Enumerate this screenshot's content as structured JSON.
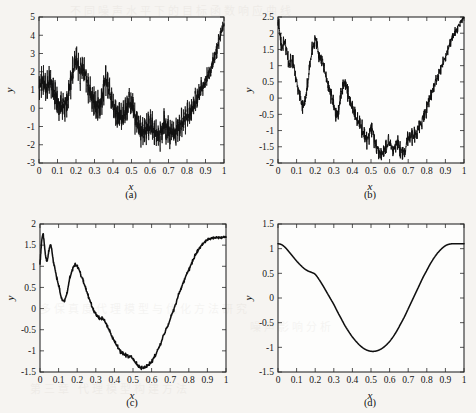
{
  "figure": {
    "layout": "2x2 grid of line plots",
    "background_color": "#f6f4f1",
    "line_color": "#101010",
    "axis_color": "#2a2a2a"
  },
  "labels": {
    "xlabel": "x",
    "ylabel": "y",
    "caption_a": "(a)",
    "caption_b": "(b)",
    "caption_c": "(c)",
    "caption_d": "(d)"
  },
  "xticks": [
    "0",
    "0.1",
    "0.2",
    "0.3",
    "0.4",
    "0.5",
    "0.6",
    "0.7",
    "0.8",
    "0.9",
    "1"
  ],
  "chart_data": [
    {
      "type": "line",
      "panel": "a",
      "title": "(a)",
      "xlabel": "x",
      "ylabel": "y",
      "xlim": [
        0,
        1
      ],
      "ylim": [
        -3,
        5
      ],
      "xticks": [
        0,
        0.1,
        0.2,
        0.3,
        0.4,
        0.5,
        0.6,
        0.7,
        0.8,
        0.9,
        1
      ],
      "xticklabels": [
        "0",
        "0.1",
        "0.2",
        "0.3",
        "0.4",
        "0.5",
        "0.6",
        "0.7",
        "0.8",
        "0.9",
        "1"
      ],
      "yticks": [
        -3,
        -2,
        -1,
        0,
        1,
        2,
        3,
        4,
        5
      ],
      "yticklabels": [
        "-3",
        "-2",
        "-1",
        "0",
        "1",
        "2",
        "3",
        "4",
        "5"
      ],
      "grid": false,
      "legend": false,
      "noise_level": "high",
      "description": "Very noisy oscillatory signal: dense high-frequency jitter about a wavy trend, amplitude roughly +/-1.5 around the trend, decaying toward x=1.",
      "trend_x": [
        0.0,
        0.02,
        0.04,
        0.06,
        0.08,
        0.1,
        0.12,
        0.14,
        0.16,
        0.18,
        0.2,
        0.22,
        0.24,
        0.26,
        0.28,
        0.3,
        0.32,
        0.34,
        0.36,
        0.38,
        0.4,
        0.42,
        0.44,
        0.46,
        0.48,
        0.5,
        0.52,
        0.54,
        0.56,
        0.58,
        0.6,
        0.62,
        0.64,
        0.66,
        0.68,
        0.7,
        0.72,
        0.74,
        0.76,
        0.78,
        0.8,
        0.82,
        0.84,
        0.86,
        0.88,
        0.9,
        0.92,
        0.94,
        0.96,
        0.98,
        1.0
      ],
      "trend_y": [
        1.1,
        1.55,
        1.05,
        1.6,
        0.95,
        0.4,
        0.05,
        0.2,
        0.85,
        1.9,
        2.6,
        2.1,
        2.2,
        1.45,
        0.75,
        0.25,
        0.1,
        0.55,
        1.45,
        0.8,
        0.2,
        -0.25,
        -0.55,
        -0.35,
        0.1,
        0.2,
        -0.55,
        -1.05,
        -1.35,
        -1.15,
        -1.05,
        -1.2,
        -1.45,
        -1.25,
        -0.95,
        -1.15,
        -1.35,
        -1.2,
        -0.95,
        -0.75,
        -0.45,
        -0.15,
        0.2,
        0.6,
        1.05,
        1.5,
        2.0,
        2.55,
        3.2,
        3.95,
        4.6
      ],
      "ymin_observed": -3.0,
      "ymax_observed": 4.75
    },
    {
      "type": "line",
      "panel": "b",
      "title": "(b)",
      "xlabel": "x",
      "ylabel": "y",
      "xlim": [
        0,
        1
      ],
      "ylim": [
        -2,
        2.5
      ],
      "xticks": [
        0,
        0.1,
        0.2,
        0.3,
        0.4,
        0.5,
        0.6,
        0.7,
        0.8,
        0.9,
        1
      ],
      "xticklabels": [
        "0",
        "0.1",
        "0.2",
        "0.3",
        "0.4",
        "0.5",
        "0.6",
        "0.7",
        "0.8",
        "0.9",
        "1"
      ],
      "yticks": [
        -2,
        -1.5,
        -1,
        -0.5,
        0,
        0.5,
        1,
        1.5,
        2,
        2.5
      ],
      "yticklabels": [
        "-2",
        "-1.5",
        "-1",
        "-0.5",
        "0",
        "0.5",
        "1",
        "1.5",
        "2",
        "2.5"
      ],
      "grid": false,
      "legend": false,
      "noise_level": "medium",
      "description": "Moderately noisy curve: starts near 2.5, noisy decay, local peak 1.85 at x=0.2, peak 0.55 at x=0.35, minimum about -1.7 near x=0.55, smooth rise to 2.5 at x=1.",
      "trend_x": [
        0.0,
        0.02,
        0.04,
        0.06,
        0.08,
        0.1,
        0.12,
        0.14,
        0.16,
        0.18,
        0.2,
        0.22,
        0.24,
        0.26,
        0.28,
        0.3,
        0.32,
        0.34,
        0.36,
        0.38,
        0.4,
        0.42,
        0.44,
        0.46,
        0.48,
        0.5,
        0.52,
        0.54,
        0.56,
        0.58,
        0.6,
        0.62,
        0.64,
        0.66,
        0.68,
        0.7,
        0.72,
        0.74,
        0.76,
        0.78,
        0.8,
        0.82,
        0.84,
        0.86,
        0.88,
        0.9,
        0.92,
        0.94,
        0.96,
        0.98,
        1.0
      ],
      "trend_y": [
        2.45,
        1.55,
        1.7,
        1.05,
        1.15,
        0.55,
        0.0,
        -0.2,
        0.45,
        1.35,
        1.82,
        1.35,
        1.1,
        0.6,
        0.15,
        -0.25,
        -0.5,
        0.1,
        0.52,
        0.05,
        -0.3,
        -0.6,
        -0.8,
        -1.05,
        -1.3,
        -0.95,
        -1.3,
        -1.6,
        -1.7,
        -1.55,
        -1.4,
        -1.55,
        -1.38,
        -1.6,
        -1.62,
        -1.25,
        -1.22,
        -1.1,
        -0.85,
        -0.6,
        -0.3,
        0.05,
        0.35,
        0.7,
        1.0,
        1.3,
        1.6,
        1.9,
        2.1,
        2.35,
        2.5
      ],
      "ymin_observed": -1.72,
      "ymax_observed": 2.5
    },
    {
      "type": "line",
      "panel": "c",
      "title": "(c)",
      "xlabel": "x",
      "ylabel": "y",
      "xlim": [
        0,
        1
      ],
      "ylim": [
        -1.5,
        2
      ],
      "xticks": [
        0,
        0.1,
        0.2,
        0.3,
        0.4,
        0.5,
        0.6,
        0.7,
        0.8,
        0.9,
        1
      ],
      "xticklabels": [
        "0",
        "0.1",
        "0.2",
        "0.3",
        "0.4",
        "0.5",
        "0.6",
        "0.7",
        "0.8",
        "0.9",
        "1"
      ],
      "yticks": [
        -1.5,
        -1,
        -0.5,
        0,
        0.5,
        1,
        1.5,
        2
      ],
      "yticklabels": [
        "-1.5",
        "-1",
        "-0.5",
        "0",
        "0.5",
        "1",
        "1.5",
        "2"
      ],
      "grid": false,
      "legend": false,
      "noise_level": "low",
      "description": "Nearly smooth curve with small jitter only near x=0: starts about 1.0-1.7, dips to 0.2 at x=0.12, local peak 1.0 at x=0.19, shoulder at x=0.33, minimum -1.4 at x=0.55, rises smoothly to 1.7 at x=1.",
      "trend_x": [
        0.0,
        0.02,
        0.04,
        0.06,
        0.08,
        0.1,
        0.12,
        0.14,
        0.16,
        0.18,
        0.2,
        0.22,
        0.24,
        0.26,
        0.28,
        0.3,
        0.32,
        0.34,
        0.36,
        0.38,
        0.4,
        0.42,
        0.44,
        0.46,
        0.48,
        0.5,
        0.52,
        0.54,
        0.56,
        0.58,
        0.6,
        0.62,
        0.64,
        0.66,
        0.68,
        0.7,
        0.72,
        0.74,
        0.76,
        0.78,
        0.8,
        0.82,
        0.84,
        0.86,
        0.88,
        0.9,
        0.92,
        0.94,
        0.96,
        0.98,
        1.0
      ],
      "trend_y": [
        1.05,
        1.62,
        1.2,
        1.42,
        0.95,
        0.55,
        0.2,
        0.3,
        0.7,
        0.98,
        1.0,
        0.8,
        0.55,
        0.3,
        0.05,
        -0.12,
        -0.22,
        -0.25,
        -0.4,
        -0.6,
        -0.78,
        -0.92,
        -1.05,
        -1.1,
        -1.12,
        -1.2,
        -1.32,
        -1.4,
        -1.4,
        -1.35,
        -1.25,
        -1.1,
        -0.92,
        -0.7,
        -0.48,
        -0.25,
        0.0,
        0.25,
        0.5,
        0.72,
        0.92,
        1.12,
        1.3,
        1.45,
        1.55,
        1.62,
        1.66,
        1.68,
        1.68,
        1.68,
        1.7
      ],
      "ymin_observed": -1.41,
      "ymax_observed": 1.72
    },
    {
      "type": "line",
      "panel": "d",
      "title": "(d)",
      "xlabel": "x",
      "ylabel": "y",
      "xlim": [
        0,
        1
      ],
      "ylim": [
        -1.5,
        1.5
      ],
      "xticks": [
        0,
        0.1,
        0.2,
        0.3,
        0.4,
        0.5,
        0.6,
        0.7,
        0.8,
        0.9,
        1
      ],
      "xticklabels": [
        "0",
        "0.1",
        "0.2",
        "0.3",
        "0.4",
        "0.5",
        "0.6",
        "0.7",
        "0.8",
        "0.9",
        "1"
      ],
      "yticks": [
        -1.5,
        -1,
        -0.5,
        0,
        0.5,
        1,
        1.5
      ],
      "yticklabels": [
        "-1.5",
        "-1",
        "-0.5",
        "0",
        "0.5",
        "1",
        "1.5"
      ],
      "grid": false,
      "legend": false,
      "noise_level": "none",
      "description": "Smooth noise-free cosine-like curve: starts 1.1, shoulder near x=0.18 at y=0.5, minimum -1.08 at x=0.51, rises to 1.1 at x=1.",
      "trend_x": [
        0.0,
        0.02,
        0.04,
        0.06,
        0.08,
        0.1,
        0.12,
        0.14,
        0.16,
        0.18,
        0.2,
        0.22,
        0.24,
        0.26,
        0.28,
        0.3,
        0.32,
        0.34,
        0.36,
        0.38,
        0.4,
        0.42,
        0.44,
        0.46,
        0.48,
        0.5,
        0.52,
        0.54,
        0.56,
        0.58,
        0.6,
        0.62,
        0.64,
        0.66,
        0.68,
        0.7,
        0.72,
        0.74,
        0.76,
        0.78,
        0.8,
        0.82,
        0.84,
        0.86,
        0.88,
        0.9,
        0.92,
        0.94,
        0.96,
        0.98,
        1.0
      ],
      "trend_y": [
        1.1,
        1.08,
        1.02,
        0.93,
        0.84,
        0.75,
        0.67,
        0.6,
        0.55,
        0.52,
        0.48,
        0.38,
        0.26,
        0.13,
        0.0,
        -0.13,
        -0.28,
        -0.42,
        -0.56,
        -0.68,
        -0.79,
        -0.88,
        -0.96,
        -1.02,
        -1.06,
        -1.08,
        -1.08,
        -1.06,
        -1.02,
        -0.96,
        -0.88,
        -0.78,
        -0.66,
        -0.52,
        -0.38,
        -0.22,
        -0.06,
        0.1,
        0.26,
        0.42,
        0.56,
        0.7,
        0.82,
        0.92,
        1.0,
        1.06,
        1.09,
        1.1,
        1.1,
        1.1,
        1.1
      ],
      "ymin_observed": -1.08,
      "ymax_observed": 1.1
    }
  ]
}
